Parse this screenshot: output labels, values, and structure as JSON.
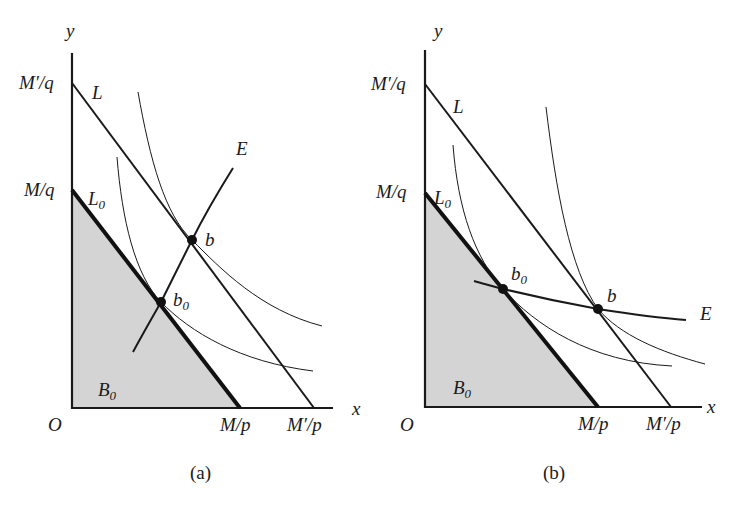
{
  "figure": {
    "panels": [
      {
        "id": "a",
        "caption": "(a)",
        "axes": {
          "x_label": "x",
          "y_label": "y",
          "origin_label": "O"
        },
        "y_intercepts": {
          "new": "M′/q",
          "old": "M/q"
        },
        "x_intercepts": {
          "old": "M/p",
          "new": "M′/p"
        },
        "lines": {
          "new_budget": "L",
          "old_budget": "L",
          "old_budget_sub": "0",
          "expansion_path": "E"
        },
        "points": {
          "new": "b",
          "old": "b",
          "old_sub": "0"
        },
        "region": {
          "label": "B",
          "sub": "0"
        }
      },
      {
        "id": "b",
        "caption": "(b)",
        "axes": {
          "x_label": "x",
          "y_label": "y",
          "origin_label": "O"
        },
        "y_intercepts": {
          "new": "M′/q",
          "old": "M/q"
        },
        "x_intercepts": {
          "old": "M/p",
          "new": "M′/p"
        },
        "lines": {
          "new_budget": "L",
          "old_budget": "L",
          "old_budget_sub": "0",
          "expansion_path": "E"
        },
        "points": {
          "new": "b",
          "old": "b",
          "old_sub": "0"
        },
        "region": {
          "label": "B",
          "sub": "0"
        }
      }
    ],
    "colors": {
      "ink": "#1a1a1a",
      "shade": "#d4d4d4",
      "background": "#ffffff"
    }
  }
}
